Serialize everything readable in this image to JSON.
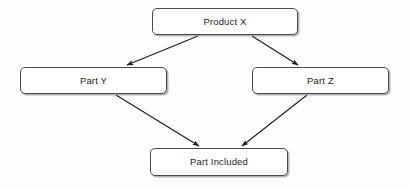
{
  "diagram": {
    "type": "flowchart",
    "title": "",
    "background_color": "#fdfdfb",
    "node_fill_color": "#ffffff",
    "node_border_color": "#4a4a4a",
    "edge_color": "#1c1c1c",
    "nodes": [
      {
        "id": "product-x",
        "label": "Product X",
        "shape": "rounded-rectangle",
        "x": 152,
        "y": 8,
        "width": 146,
        "height": 27
      },
      {
        "id": "part-y",
        "label": "Part Y",
        "shape": "rounded-rectangle",
        "x": 20,
        "y": 67,
        "width": 147,
        "height": 27
      },
      {
        "id": "part-z",
        "label": "Part Z",
        "shape": "rounded-rectangle",
        "x": 252,
        "y": 67,
        "width": 137,
        "height": 27
      },
      {
        "id": "part-included",
        "label": "Part Included",
        "shape": "rounded-rectangle",
        "x": 150,
        "y": 148,
        "width": 138,
        "height": 28
      }
    ],
    "edges": [
      {
        "id": "edge-product-x-to-part-y",
        "from": "product-x",
        "to": "part-y",
        "label": "",
        "arrowhead": "filled-triangle",
        "x1": 198,
        "y1": 36,
        "x2": 127,
        "y2": 65
      },
      {
        "id": "edge-product-x-to-part-z",
        "from": "product-x",
        "to": "part-z",
        "label": "",
        "arrowhead": "filled-triangle",
        "x1": 252,
        "y1": 36,
        "x2": 298,
        "y2": 65
      },
      {
        "id": "edge-part-y-to-part-included",
        "from": "part-y",
        "to": "part-included",
        "label": "",
        "arrowhead": "filled-triangle",
        "x1": 116,
        "y1": 95,
        "x2": 199,
        "y2": 146
      },
      {
        "id": "edge-part-z-to-part-included",
        "from": "part-z",
        "to": "part-included",
        "label": "",
        "arrowhead": "filled-triangle",
        "x1": 307,
        "y1": 95,
        "x2": 242,
        "y2": 146
      }
    ]
  }
}
